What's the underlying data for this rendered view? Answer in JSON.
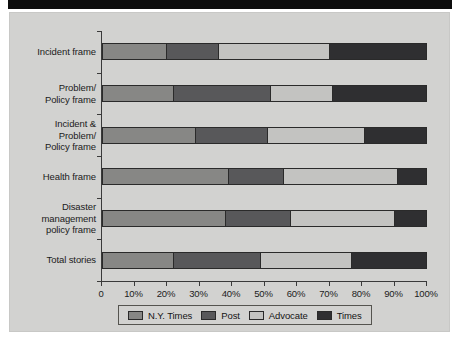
{
  "banner": {
    "present": true,
    "color": "#0d0d0d"
  },
  "figure": {
    "background": "#d2d2d0"
  },
  "chart_data": {
    "type": "bar",
    "orientation": "horizontal",
    "stacked": true,
    "normalized": "100%",
    "title": "",
    "subtitle": "",
    "xlabel": "",
    "ylabel": "",
    "xlim": [
      0,
      100
    ],
    "grid": false,
    "legend_position": "bottom",
    "categories": [
      "Incident frame",
      "Problem/\nPolicy frame",
      "Incident &\nProblem/\nPolicy frame",
      "Health frame",
      "Disaster\nmanagement\npolicy frame",
      "Total stories"
    ],
    "series": [
      {
        "name": "N.Y. Times",
        "color": "#878785",
        "values": [
          20,
          22,
          29,
          39,
          38,
          22
        ]
      },
      {
        "name": "Post",
        "color": "#58585a",
        "values": [
          16,
          30,
          22,
          17,
          20,
          27
        ]
      },
      {
        "name": "Advocate",
        "color": "#c3c3c1",
        "values": [
          34,
          19,
          30,
          35,
          32,
          28
        ]
      },
      {
        "name": "Times",
        "color": "#2f2f31",
        "values": [
          30,
          29,
          19,
          9,
          10,
          23
        ]
      }
    ],
    "xticks": [
      0,
      10,
      20,
      30,
      40,
      50,
      60,
      70,
      80,
      90,
      100
    ],
    "xticklabels": [
      "0",
      "10%",
      "20%",
      "30%",
      "40%",
      "50%",
      "60%",
      "70%",
      "80%",
      "90%",
      "100%"
    ]
  }
}
